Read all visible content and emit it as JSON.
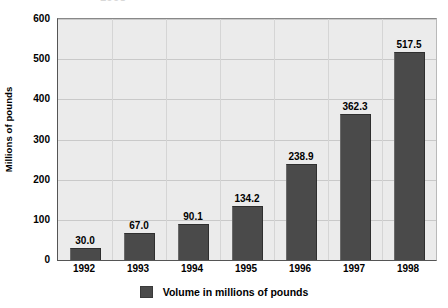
{
  "chart_data": {
    "type": "bar",
    "title": "",
    "title_remnant": "1998",
    "xlabel": "",
    "ylabel": "Millions of pounds",
    "categories": [
      "1992",
      "1993",
      "1994",
      "1995",
      "1996",
      "1997",
      "1998"
    ],
    "values": [
      30.0,
      67.0,
      90.1,
      134.2,
      238.9,
      362.3,
      517.5
    ],
    "value_labels": [
      "30.0",
      "67.0",
      "90.1",
      "134.2",
      "238.9",
      "362.3",
      "517.5"
    ],
    "series": [
      {
        "name": "Volume in millions of pounds",
        "values": [
          30.0,
          67.0,
          90.1,
          134.2,
          238.9,
          362.3,
          517.5
        ],
        "color": "#4a4a4a"
      }
    ],
    "ylim": [
      0,
      600
    ],
    "y_ticks": [
      0,
      100,
      200,
      300,
      400,
      500,
      600
    ],
    "y_tick_labels": [
      "0",
      "100",
      "200",
      "300",
      "400",
      "500",
      "600"
    ],
    "grid": true,
    "grid_color": "#c9c9c9",
    "plot_background": "#ebebeb",
    "legend": {
      "position": "bottom",
      "entries": [
        {
          "label": "Volume in millions of pounds",
          "color": "#4a4a4a"
        }
      ]
    }
  },
  "legend": {
    "label": "Volume in millions of pounds"
  },
  "axes": {
    "y_title": "Millions of pounds"
  }
}
